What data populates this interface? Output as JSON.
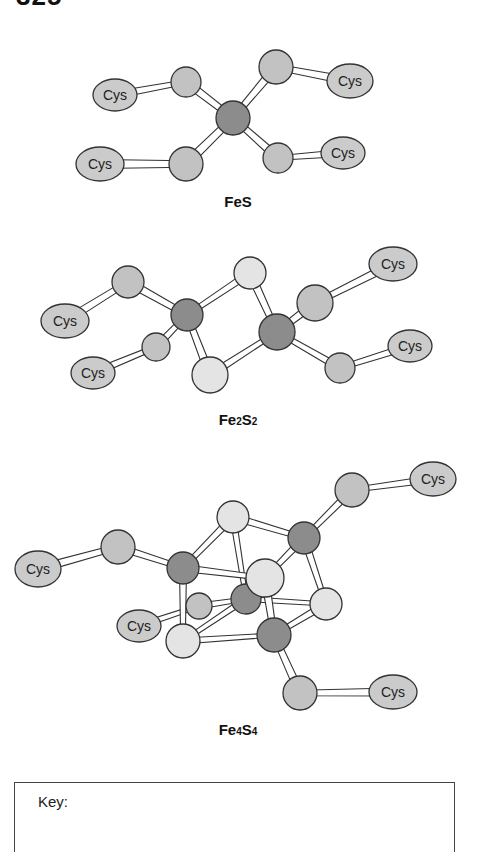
{
  "heading": "325",
  "colors": {
    "fe": "#8c8c8c",
    "cys_s": "#c2c2c2",
    "bridge_s": "#e4e4e4",
    "cys": "#cbcbcb",
    "outline": "#333333",
    "bond_fill": "#ffffff"
  },
  "diagrams": [
    {
      "name": "FeS",
      "label": "FeS",
      "label_pos": [
        238,
        207
      ],
      "atoms": [
        {
          "id": "s1",
          "type": "cys_s",
          "x": 186,
          "y": 82,
          "r": 15
        },
        {
          "id": "s2",
          "type": "cys_s",
          "x": 276,
          "y": 67,
          "r": 17
        },
        {
          "id": "s3",
          "type": "cys_s",
          "x": 186,
          "y": 164,
          "r": 17
        },
        {
          "id": "s4",
          "type": "cys_s",
          "x": 278,
          "y": 158,
          "r": 15
        },
        {
          "id": "fe",
          "type": "fe",
          "x": 233,
          "y": 118,
          "r": 17
        }
      ],
      "cys": [
        {
          "id": "c1",
          "x": 115,
          "y": 95,
          "rx": 22,
          "ry": 16,
          "label": "Cys",
          "fs": 13
        },
        {
          "id": "c2",
          "x": 350,
          "y": 81,
          "rx": 23,
          "ry": 17,
          "label": "Cys",
          "fs": 15
        },
        {
          "id": "c3",
          "x": 100,
          "y": 164,
          "rx": 24,
          "ry": 17,
          "label": "Cys",
          "fs": 15
        },
        {
          "id": "c4",
          "x": 343,
          "y": 153,
          "rx": 22,
          "ry": 16,
          "label": "Cys",
          "fs": 13
        }
      ],
      "bonds": [
        [
          "c1",
          "s1",
          7
        ],
        [
          "c2",
          "s2",
          8
        ],
        [
          "c3",
          "s3",
          9
        ],
        [
          "c4",
          "s4",
          7
        ],
        [
          "s1",
          "fe",
          8
        ],
        [
          "s2",
          "fe",
          8
        ],
        [
          "s3",
          "fe",
          9
        ],
        [
          "s4",
          "fe",
          8
        ]
      ]
    },
    {
      "name": "Fe2S2",
      "label": "Fe",
      "label_sub1": "2",
      "label_mid": "S",
      "label_sub2": "2",
      "label_pos": [
        238,
        425
      ],
      "atoms": [
        {
          "id": "s1",
          "type": "cys_s",
          "x": 128,
          "y": 282,
          "r": 16
        },
        {
          "id": "s2",
          "type": "cys_s",
          "x": 156,
          "y": 347,
          "r": 14
        },
        {
          "id": "s3",
          "type": "cys_s",
          "x": 315,
          "y": 303,
          "r": 18
        },
        {
          "id": "s4",
          "type": "cys_s",
          "x": 340,
          "y": 368,
          "r": 15
        },
        {
          "id": "bt",
          "type": "bridge_s",
          "x": 250,
          "y": 273,
          "r": 16
        },
        {
          "id": "bb",
          "type": "bridge_s",
          "x": 210,
          "y": 375,
          "r": 18
        },
        {
          "id": "fe1",
          "type": "fe",
          "x": 187,
          "y": 315,
          "r": 16
        },
        {
          "id": "fe2",
          "type": "fe",
          "x": 277,
          "y": 332,
          "r": 18
        }
      ],
      "cys": [
        {
          "id": "c1",
          "x": 65,
          "y": 321,
          "rx": 24,
          "ry": 17,
          "label": "Cys",
          "fs": 15
        },
        {
          "id": "c2",
          "x": 93,
          "y": 373,
          "rx": 22,
          "ry": 16,
          "label": "Cys",
          "fs": 13
        },
        {
          "id": "c3",
          "x": 393,
          "y": 264,
          "rx": 24,
          "ry": 17,
          "label": "Cys",
          "fs": 15
        },
        {
          "id": "c4",
          "x": 410,
          "y": 346,
          "rx": 22,
          "ry": 16,
          "label": "Cys",
          "fs": 13
        }
      ],
      "bonds": [
        [
          "c1",
          "s1",
          8
        ],
        [
          "c2",
          "s2",
          7
        ],
        [
          "c3",
          "s3",
          8
        ],
        [
          "c4",
          "s4",
          7
        ],
        [
          "s1",
          "fe1",
          8
        ],
        [
          "s2",
          "fe1",
          7
        ],
        [
          "bt",
          "fe1",
          7
        ],
        [
          "bb",
          "fe1",
          8
        ],
        [
          "bt",
          "fe2",
          8
        ],
        [
          "bb",
          "fe2",
          7
        ],
        [
          "s3",
          "fe2",
          8
        ],
        [
          "s4",
          "fe2",
          7
        ]
      ]
    },
    {
      "name": "Fe4S4",
      "label": "Fe",
      "label_sub1": "4",
      "label_mid": "S",
      "label_sub2": "4",
      "label_pos": [
        238,
        735
      ],
      "atoms": [
        {
          "id": "sl",
          "type": "cys_s",
          "x": 118,
          "y": 547,
          "r": 17
        },
        {
          "id": "str",
          "type": "cys_s",
          "x": 352,
          "y": 490,
          "r": 17
        },
        {
          "id": "sb",
          "type": "cys_s",
          "x": 300,
          "y": 693,
          "r": 17
        },
        {
          "id": "sm",
          "type": "cys_s",
          "x": 199,
          "y": 606,
          "r": 13
        },
        {
          "id": "fec",
          "type": "fe",
          "x": 246,
          "y": 599,
          "r": 15
        },
        {
          "id": "stop",
          "type": "bridge_s",
          "x": 233,
          "y": 517,
          "r": 16
        },
        {
          "id": "sbl",
          "type": "bridge_s",
          "x": 183,
          "y": 641,
          "r": 17
        },
        {
          "id": "fetl",
          "type": "fe",
          "x": 183,
          "y": 568,
          "r": 16
        },
        {
          "id": "feb",
          "type": "fe",
          "x": 274,
          "y": 635,
          "r": 17
        },
        {
          "id": "sr",
          "type": "bridge_s",
          "x": 326,
          "y": 604,
          "r": 16
        },
        {
          "id": "fetr",
          "type": "fe",
          "x": 304,
          "y": 538,
          "r": 16
        },
        {
          "id": "sc",
          "type": "bridge_s",
          "x": 265,
          "y": 578,
          "r": 19
        }
      ],
      "cys": [
        {
          "id": "c1",
          "x": 38,
          "y": 569,
          "rx": 23,
          "ry": 18,
          "label": "Cys",
          "fs": 15
        },
        {
          "id": "c2",
          "x": 139,
          "y": 626,
          "rx": 22,
          "ry": 16,
          "label": "Cys",
          "fs": 14
        },
        {
          "id": "c3",
          "x": 433,
          "y": 479,
          "rx": 23,
          "ry": 17,
          "label": "Cys",
          "fs": 15
        },
        {
          "id": "c4",
          "x": 393,
          "y": 692,
          "rx": 24,
          "ry": 17,
          "label": "Cys",
          "fs": 15
        }
      ],
      "bonds": [
        [
          "c1",
          "sl",
          8
        ],
        [
          "c2",
          "sm",
          6
        ],
        [
          "c3",
          "str",
          7
        ],
        [
          "c4",
          "sb",
          8
        ],
        [
          "sl",
          "fetl",
          7
        ],
        [
          "sm",
          "fec",
          6
        ],
        [
          "str",
          "fetr",
          7
        ],
        [
          "sb",
          "feb",
          8
        ],
        [
          "stop",
          "fetl",
          7
        ],
        [
          "stop",
          "fetr",
          7
        ],
        [
          "stop",
          "fec",
          6
        ],
        [
          "fetl",
          "sbl",
          7
        ],
        [
          "fetl",
          "sc",
          7
        ],
        [
          "fec",
          "sbl",
          6
        ],
        [
          "fec",
          "sr",
          5
        ],
        [
          "sbl",
          "feb",
          6
        ],
        [
          "fetr",
          "sc",
          7
        ],
        [
          "fetr",
          "sr",
          7
        ],
        [
          "sc",
          "feb",
          8
        ],
        [
          "sr",
          "feb",
          7
        ]
      ]
    }
  ],
  "key": {
    "title": "Key:"
  }
}
